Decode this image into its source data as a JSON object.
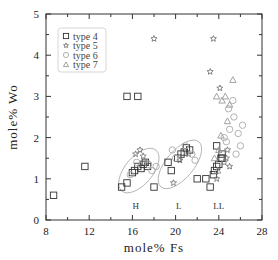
{
  "chart_data": {
    "type": "scatter",
    "title": "",
    "xlabel": "mole% Fs",
    "ylabel": "mole% Wo",
    "xlim": [
      8,
      28
    ],
    "ylim": [
      0,
      5
    ],
    "x_ticks": [
      8,
      12,
      16,
      20,
      24,
      28
    ],
    "y_ticks": [
      0,
      1,
      2,
      3,
      4,
      5
    ],
    "grid": false,
    "legend_position": "upper-left",
    "legend": [
      "type 4",
      "type 5",
      "type 6",
      "type 7"
    ],
    "group_labels": [
      {
        "text": "H",
        "x": 16.3,
        "y": 0.35
      },
      {
        "text": "L",
        "x": 20.3,
        "y": 0.35
      },
      {
        "text": "LL",
        "x": 24.0,
        "y": 0.35
      }
    ],
    "ellipses": [
      {
        "cx": 16.6,
        "cy": 1.2,
        "rx": 1.9,
        "ry": 0.75,
        "angle": -50
      },
      {
        "cx": 20.4,
        "cy": 1.35,
        "rx": 2.1,
        "ry": 0.75,
        "angle": -50
      }
    ],
    "series": [
      {
        "name": "type 4",
        "marker": "square",
        "color": "#333333",
        "points": [
          [
            8.7,
            0.6
          ],
          [
            11.6,
            1.3
          ],
          [
            15.0,
            0.8
          ],
          [
            15.5,
            0.9
          ],
          [
            16.0,
            1.15
          ],
          [
            16.2,
            1.2
          ],
          [
            16.5,
            1.3
          ],
          [
            16.8,
            1.25
          ],
          [
            17.0,
            1.35
          ],
          [
            17.2,
            1.4
          ],
          [
            17.4,
            1.3
          ],
          [
            15.5,
            3.0
          ],
          [
            16.5,
            3.0
          ],
          [
            18.0,
            0.8
          ],
          [
            19.3,
            1.4
          ],
          [
            19.6,
            1.2
          ],
          [
            20.2,
            1.5
          ],
          [
            20.5,
            1.6
          ],
          [
            20.8,
            1.65
          ],
          [
            21.0,
            1.75
          ],
          [
            21.3,
            1.7
          ],
          [
            22.0,
            1.0
          ],
          [
            22.8,
            1.0
          ],
          [
            23.2,
            0.8
          ],
          [
            23.5,
            1.1
          ],
          [
            23.6,
            1.2
          ],
          [
            23.8,
            1.3
          ],
          [
            24.0,
            1.35
          ],
          [
            24.2,
            1.5
          ],
          [
            24.3,
            1.6
          ],
          [
            23.8,
            1.8
          ],
          [
            24.3,
            1.5
          ]
        ]
      },
      {
        "name": "type 5",
        "marker": "star",
        "color": "#777777",
        "points": [
          [
            18.0,
            4.4
          ],
          [
            23.5,
            4.4
          ],
          [
            23.2,
            3.6
          ],
          [
            24.1,
            3.2
          ],
          [
            16.3,
            1.6
          ],
          [
            16.7,
            1.7
          ],
          [
            17.0,
            1.55
          ],
          [
            17.3,
            1.4
          ],
          [
            19.8,
            0.9
          ],
          [
            20.4,
            1.45
          ],
          [
            21.2,
            1.6
          ],
          [
            23.8,
            1.0
          ],
          [
            24.5,
            1.4
          ],
          [
            24.7,
            1.5
          ],
          [
            25.0,
            1.3
          ],
          [
            24.8,
            1.7
          ]
        ]
      },
      {
        "name": "type 6",
        "marker": "circle",
        "color": "#aaaaaa",
        "points": [
          [
            15.8,
            1.1
          ],
          [
            16.4,
            1.4
          ],
          [
            17.5,
            1.35
          ],
          [
            17.8,
            1.2
          ],
          [
            18.2,
            1.3
          ],
          [
            19.7,
            1.7
          ],
          [
            20.0,
            1.5
          ],
          [
            20.9,
            1.8
          ],
          [
            21.5,
            1.6
          ],
          [
            21.8,
            1.45
          ],
          [
            24.5,
            2.0
          ],
          [
            25.0,
            2.2
          ],
          [
            25.4,
            2.5
          ],
          [
            25.8,
            2.1
          ],
          [
            26.0,
            1.8
          ],
          [
            25.6,
            1.6
          ],
          [
            24.9,
            2.7
          ],
          [
            25.3,
            2.9
          ],
          [
            26.2,
            2.3
          ],
          [
            24.7,
            1.9
          ]
        ]
      },
      {
        "name": "type 7",
        "marker": "triangle",
        "color": "#999999",
        "points": [
          [
            24.6,
            3.0
          ],
          [
            25.0,
            2.8
          ],
          [
            24.3,
            2.9
          ],
          [
            25.3,
            3.4
          ],
          [
            23.8,
            3.0
          ],
          [
            24.8,
            2.4
          ],
          [
            24.2,
            2.05
          ],
          [
            23.6,
            1.5
          ],
          [
            24.0,
            1.7
          ],
          [
            23.9,
            1.2
          ]
        ]
      }
    ]
  }
}
